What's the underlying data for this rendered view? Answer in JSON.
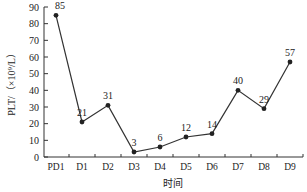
{
  "chart_data": {
    "type": "line",
    "title": "",
    "xlabel": "时间",
    "ylabel": "PLT/（×10⁹/L）",
    "categories": [
      "PD1",
      "D1",
      "D2",
      "D3",
      "D4",
      "D5",
      "D6",
      "D7",
      "D8",
      "D9"
    ],
    "series": [
      {
        "name": "PLT",
        "values": [
          85,
          21,
          31,
          3,
          6,
          12,
          14,
          40,
          29,
          57
        ]
      }
    ],
    "ylim": [
      0,
      90
    ],
    "yticks": [
      0,
      10,
      20,
      30,
      40,
      50,
      60,
      70,
      80,
      90
    ],
    "grid": false,
    "legend": "none",
    "data_labels": true,
    "colors": {
      "line": "#333333",
      "marker": "#222222",
      "axis": "#333333"
    }
  }
}
